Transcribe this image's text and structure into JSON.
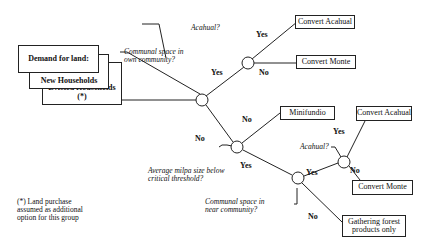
{
  "demand": {
    "title": "Demand for land:",
    "group1": "New Households",
    "group2": "Evicted Households (*)"
  },
  "footnote": "(*) Land purchase assumed as additional option for this group",
  "questions": {
    "q_own": "Communal space in own community?",
    "q_acahual_top": "Acahual?",
    "q_milpa": "Average milpa size below critical threshold?",
    "q_near": "Communal space in near community?",
    "q_acahual_bottom": "Acahual?"
  },
  "outcomes": {
    "convert_acahual_top": "Convert Acahual",
    "convert_monte_top": "Convert Monte",
    "minifundio": "Minifundio",
    "convert_acahual_bottom": "Convert Acahual",
    "convert_monte_bottom": "Convert Monte",
    "gathering": "Gathering forest products only"
  },
  "edges": {
    "own_yes": "Yes",
    "own_no": "No",
    "acahual_top_yes": "Yes",
    "acahual_top_no": "No",
    "milpa_no": "No",
    "milpa_yes": "Yes",
    "near_yes": "Yes",
    "near_no": "No",
    "acahual_bottom_yes": "Yes",
    "acahual_bottom_no": "No"
  }
}
